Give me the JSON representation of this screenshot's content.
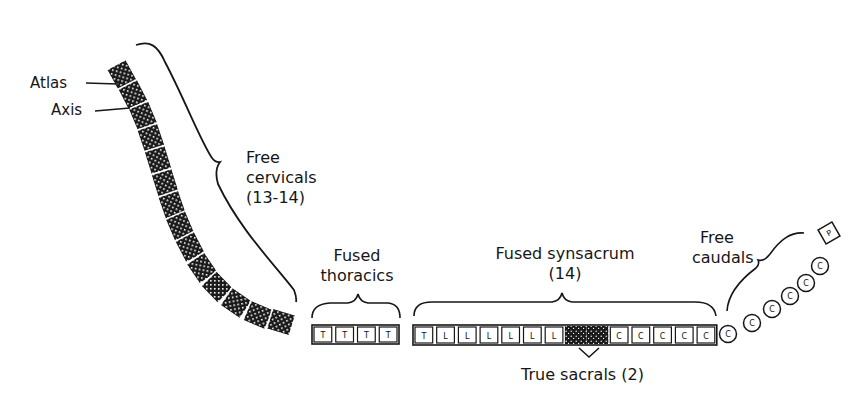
{
  "diagram": {
    "type": "vertebral-column-schematic",
    "labels": {
      "atlas": "Atlas",
      "axis": "Axis",
      "free_cervicals": [
        "Free",
        "cervicals",
        "(13-14)"
      ],
      "fused_thoracics": [
        "Fused",
        "thoracics"
      ],
      "fused_synsacrum": [
        "Fused synsacrum",
        "(14)"
      ],
      "free_caudals": [
        "Free",
        "caudals"
      ],
      "true_sacrals": "True sacrals (2)"
    },
    "regions": {
      "cervical": {
        "count": 14,
        "fill": "crosshatch-dark"
      },
      "thoracic": {
        "letters": [
          "T",
          "T",
          "T",
          "T"
        ]
      },
      "synsacrum": {
        "letters": [
          "T",
          "L",
          "L",
          "L",
          "L",
          "L",
          "L",
          "S",
          "S",
          "C",
          "C",
          "C",
          "C",
          "C"
        ]
      },
      "caudal": {
        "letters": [
          "C",
          "C",
          "C",
          "C",
          "C",
          "C"
        ],
        "terminal": "P"
      }
    },
    "colors": {
      "ink": "#161616",
      "background": "#ffffff"
    }
  }
}
